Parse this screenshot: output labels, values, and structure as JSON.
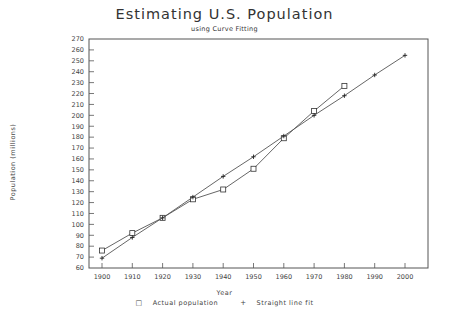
{
  "chart_data": {
    "type": "line",
    "title": "Estimating U.S. Population",
    "subtitle": "using Curve Fitting",
    "xlabel": "Year",
    "ylabel": "Population (millions)",
    "x": [
      1900,
      1910,
      1920,
      1930,
      1940,
      1950,
      1960,
      1970,
      1980,
      1990,
      2000
    ],
    "xlim": [
      1896,
      2003
    ],
    "ylim": [
      60,
      270
    ],
    "yticks": [
      60,
      70,
      80,
      90,
      100,
      110,
      120,
      130,
      140,
      150,
      160,
      170,
      180,
      190,
      200,
      210,
      220,
      230,
      240,
      250,
      260,
      270
    ],
    "xticks": [
      1900,
      1910,
      1920,
      1930,
      1940,
      1950,
      1960,
      1970,
      1980,
      1990,
      2000
    ],
    "grid": false,
    "legend_position": "bottom",
    "series": [
      {
        "name": "Actual population",
        "marker": "square",
        "x": [
          1900,
          1910,
          1920,
          1930,
          1940,
          1950,
          1960,
          1970,
          1980
        ],
        "values": [
          76,
          92,
          106,
          123,
          132,
          151,
          179,
          204,
          227
        ]
      },
      {
        "name": "Straight line fit",
        "marker": "plus",
        "x": [
          1900,
          1910,
          1920,
          1930,
          1940,
          1950,
          1960,
          1970,
          1980,
          1990,
          2000
        ],
        "values": [
          69,
          88,
          106,
          125,
          144,
          162,
          181,
          200,
          218,
          237,
          255
        ]
      }
    ]
  },
  "legend": {
    "actual_symbol": "□",
    "actual_label": "Actual population",
    "fit_symbol": "+",
    "fit_label": "Straight line fit"
  }
}
